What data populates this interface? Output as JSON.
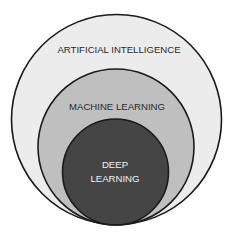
{
  "diagram": {
    "type": "nested-circles",
    "circles": [
      {
        "label": "ARTIFICIAL INTELLIGENCE",
        "fill": "#ececec",
        "text_color": "#2a2a2a"
      },
      {
        "label": "MACHINE LEARNING",
        "fill": "#bfbfbf",
        "text_color": "#2a2a2a"
      },
      {
        "label_line1": "DEEP",
        "label_line2": "LEARNING",
        "fill": "#454545",
        "text_color": "#f2f2f2"
      }
    ],
    "stroke_color": "#1a1a1a"
  }
}
